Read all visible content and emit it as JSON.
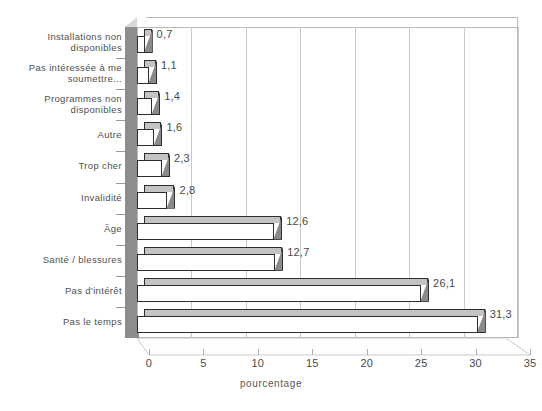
{
  "chart_data": {
    "type": "bar",
    "orientation": "horizontal",
    "style": "3d",
    "title": "",
    "xlabel": "pourcentage",
    "ylabel": "",
    "xlim": [
      0,
      35
    ],
    "xticks": [
      0,
      5,
      10,
      15,
      20,
      25,
      30,
      35
    ],
    "xtick_labels": [
      "0",
      "5",
      "10",
      "15",
      "20",
      "25",
      "30",
      "35"
    ],
    "grid": "vertical",
    "legend": "none",
    "decimal_separator": ",",
    "categories": [
      "Installations non\ndisponibles",
      "Pas intéressée à me\nsoumettre...",
      "Programmes non\ndisponibles",
      "Autre",
      "Trop cher",
      "Invalidité",
      "Âge",
      "Santé / blessures",
      "Pas d'intérêt",
      "Pas le temps"
    ],
    "values": [
      0.7,
      1.1,
      1.4,
      1.6,
      2.3,
      2.8,
      12.6,
      12.7,
      26.1,
      31.3
    ],
    "value_labels": [
      "0,7",
      "1,1",
      "1,4",
      "1,6",
      "2,3",
      "2,8",
      "12,6",
      "12,7",
      "26,1",
      "31,3"
    ],
    "colors": {
      "bar_face": "#ffffff",
      "bar_outline": "#2e2e2e",
      "bar_side": "#8a8a8a",
      "bar_top": "#c3c3c3",
      "left_wall": "#8d8d8d",
      "gridline": "#c9c9c9",
      "plot_border": "#b9b9b9",
      "text": "#4a4a4a",
      "background": "#ffffff"
    }
  }
}
